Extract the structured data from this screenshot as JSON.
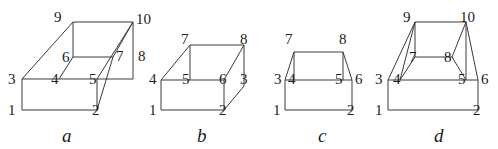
{
  "figure": {
    "background_color": "#ffffff",
    "stroke_color": "#3a3a3a",
    "text_color": "#1c1c1c",
    "panels": [
      {
        "caption": "a",
        "caption_x": 62,
        "caption_y": 126,
        "vertices": [
          {
            "id": "1",
            "label": "1",
            "x": 22,
            "y": 110,
            "lx": 8,
            "ly": 103
          },
          {
            "id": "2",
            "label": "2",
            "x": 97,
            "y": 110,
            "lx": 92,
            "ly": 103
          },
          {
            "id": "3",
            "label": "3",
            "x": 22,
            "y": 79,
            "lx": 8,
            "ly": 72
          },
          {
            "id": "4",
            "label": "4",
            "x": 59,
            "y": 79,
            "lx": 51,
            "ly": 72
          },
          {
            "id": "5",
            "label": "5",
            "x": 97,
            "y": 79,
            "lx": 89,
            "ly": 72
          },
          {
            "id": "6",
            "label": "6",
            "x": 73,
            "y": 57,
            "lx": 62,
            "ly": 50
          },
          {
            "id": "7",
            "label": "7",
            "x": 113,
            "y": 57,
            "lx": 116,
            "ly": 49
          },
          {
            "id": "8",
            "label": "8",
            "x": 133,
            "y": 79,
            "lx": 138,
            "ly": 49
          },
          {
            "id": "9",
            "label": "9",
            "x": 73,
            "y": 22,
            "lx": 54,
            "ly": 10
          },
          {
            "id": "10",
            "label": "10",
            "x": 133,
            "y": 22,
            "lx": 136,
            "ly": 12
          }
        ],
        "edges": [
          [
            "1",
            "2"
          ],
          [
            "1",
            "3"
          ],
          [
            "3",
            "4"
          ],
          [
            "4",
            "5"
          ],
          [
            "5",
            "2"
          ],
          [
            "3",
            "9"
          ],
          [
            "9",
            "6"
          ],
          [
            "6",
            "4"
          ],
          [
            "9",
            "10"
          ],
          [
            "6",
            "7"
          ],
          [
            "10",
            "8"
          ],
          [
            "8",
            "5"
          ],
          [
            "5",
            "10"
          ],
          [
            "7",
            "2"
          ],
          [
            "7",
            "10"
          ]
        ]
      },
      {
        "caption": "b",
        "caption_x": 197,
        "caption_y": 126,
        "vertices": [
          {
            "id": "1",
            "label": "1",
            "x": 161,
            "y": 110,
            "lx": 149,
            "ly": 103
          },
          {
            "id": "2",
            "label": "2",
            "x": 224,
            "y": 110,
            "lx": 219,
            "ly": 103
          },
          {
            "id": "3",
            "label": "3",
            "x": 244,
            "y": 86,
            "lx": 240,
            "ly": 72
          },
          {
            "id": "4",
            "label": "4",
            "x": 161,
            "y": 80,
            "lx": 149,
            "ly": 72
          },
          {
            "id": "5",
            "label": "5",
            "x": 190,
            "y": 80,
            "lx": 182,
            "ly": 72
          },
          {
            "id": "6",
            "label": "6",
            "x": 224,
            "y": 80,
            "lx": 219,
            "ly": 72
          },
          {
            "id": "7",
            "label": "7",
            "x": 190,
            "y": 45,
            "lx": 181,
            "ly": 32
          },
          {
            "id": "8",
            "label": "8",
            "x": 244,
            "y": 45,
            "lx": 240,
            "ly": 32
          }
        ],
        "edges": [
          [
            "1",
            "2"
          ],
          [
            "1",
            "4"
          ],
          [
            "4",
            "5"
          ],
          [
            "5",
            "6"
          ],
          [
            "6",
            "2"
          ],
          [
            "4",
            "7"
          ],
          [
            "7",
            "5"
          ],
          [
            "7",
            "8"
          ],
          [
            "8",
            "6"
          ],
          [
            "8",
            "3"
          ],
          [
            "3",
            "2"
          ]
        ]
      },
      {
        "caption": "c",
        "caption_x": 318,
        "caption_y": 126,
        "vertices": [
          {
            "id": "1",
            "label": "1",
            "x": 285,
            "y": 110,
            "lx": 273,
            "ly": 103
          },
          {
            "id": "2",
            "label": "2",
            "x": 352,
            "y": 110,
            "lx": 347,
            "ly": 103
          },
          {
            "id": "3",
            "label": "3",
            "x": 285,
            "y": 80,
            "lx": 274,
            "ly": 72
          },
          {
            "id": "4",
            "label": "4",
            "x": 294,
            "y": 80,
            "lx": 288,
            "ly": 72
          },
          {
            "id": "5",
            "label": "5",
            "x": 343,
            "y": 80,
            "lx": 335,
            "ly": 72
          },
          {
            "id": "6",
            "label": "6",
            "x": 352,
            "y": 80,
            "lx": 355,
            "ly": 72
          },
          {
            "id": "7",
            "label": "7",
            "x": 294,
            "y": 52,
            "lx": 285,
            "ly": 32
          },
          {
            "id": "8",
            "label": "8",
            "x": 343,
            "y": 52,
            "lx": 339,
            "ly": 32
          }
        ],
        "edges": [
          [
            "1",
            "2"
          ],
          [
            "1",
            "3"
          ],
          [
            "3",
            "6"
          ],
          [
            "6",
            "2"
          ],
          [
            "3",
            "7"
          ],
          [
            "7",
            "4"
          ],
          [
            "7",
            "8"
          ],
          [
            "8",
            "5"
          ],
          [
            "8",
            "6"
          ]
        ]
      },
      {
        "caption": "d",
        "caption_x": 434,
        "caption_y": 126,
        "vertices": [
          {
            "id": "1",
            "label": "1",
            "x": 388,
            "y": 110,
            "lx": 375,
            "ly": 103
          },
          {
            "id": "2",
            "label": "2",
            "x": 478,
            "y": 110,
            "lx": 473,
            "ly": 103
          },
          {
            "id": "3",
            "label": "3",
            "x": 388,
            "y": 80,
            "lx": 375,
            "ly": 72
          },
          {
            "id": "4",
            "label": "4",
            "x": 400,
            "y": 80,
            "lx": 393,
            "ly": 72
          },
          {
            "id": "5",
            "label": "5",
            "x": 466,
            "y": 80,
            "lx": 458,
            "ly": 72
          },
          {
            "id": "6",
            "label": "6",
            "x": 478,
            "y": 80,
            "lx": 481,
            "ly": 72
          },
          {
            "id": "7",
            "label": "7",
            "x": 415,
            "y": 57,
            "lx": 409,
            "ly": 50
          },
          {
            "id": "8",
            "label": "8",
            "x": 452,
            "y": 57,
            "lx": 444,
            "ly": 50
          },
          {
            "id": "9",
            "label": "9",
            "x": 415,
            "y": 22,
            "lx": 403,
            "ly": 10
          },
          {
            "id": "10",
            "label": "10",
            "x": 466,
            "y": 22,
            "lx": 460,
            "ly": 10
          }
        ],
        "edges": [
          [
            "1",
            "2"
          ],
          [
            "1",
            "3"
          ],
          [
            "3",
            "6"
          ],
          [
            "6",
            "2"
          ],
          [
            "3",
            "9"
          ],
          [
            "9",
            "10"
          ],
          [
            "10",
            "6"
          ],
          [
            "4",
            "9"
          ],
          [
            "9",
            "7"
          ],
          [
            "7",
            "8"
          ],
          [
            "8",
            "10"
          ],
          [
            "10",
            "5"
          ],
          [
            "4",
            "7"
          ],
          [
            "8",
            "5"
          ]
        ]
      }
    ]
  }
}
